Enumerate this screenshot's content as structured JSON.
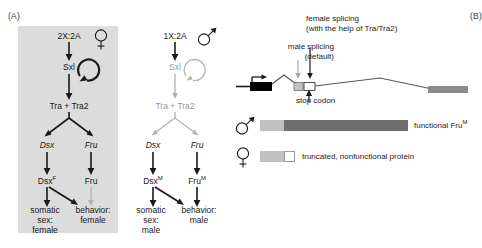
{
  "figure": {
    "panel_a_label": "(A)",
    "panel_b_label": "(B)"
  },
  "panel_a": {
    "female": {
      "sex_symbol": "female-symbol",
      "ratio": "2X:2A",
      "sxl": "Sxl",
      "tra": "Tra + Tra2",
      "dsx_gene": "Dsx",
      "fru_gene": "Fru",
      "dsx_protein": "Dsx",
      "dsx_protein_sup": "F",
      "fru_protein": "Fru",
      "fru_protein_sup": "",
      "outcome_left_line1": "somatic",
      "outcome_left_line2": "sex:",
      "outcome_left_line3": "female",
      "outcome_right_line1": "behavior:",
      "outcome_right_line2": "female"
    },
    "male": {
      "sex_symbol": "male-symbol",
      "ratio": "1X:2A",
      "sxl": "Sxl",
      "tra": "Tra + Tra2",
      "dsx_gene": "Dsx",
      "fru_gene": "Fru",
      "dsx_protein": "Dsx",
      "dsx_protein_sup": "M",
      "fru_protein": "Fru",
      "fru_protein_sup": "M",
      "outcome_left_line1": "somatic",
      "outcome_left_line2": "sex:",
      "outcome_left_line3": "male",
      "outcome_right_line1": "behavior:",
      "outcome_right_line2": "male"
    }
  },
  "panel_b": {
    "male_splicing_line1": "male splicing",
    "male_splicing_line2": "(default)",
    "female_splicing_line1": "female splicing",
    "female_splicing_line2": "(with the help of Tra/Tra2)",
    "stop_codon": "stop codon",
    "male_protein_label": "functional Fru",
    "male_protein_sup": "M",
    "female_protein_label": "truncated, nonfunctional protein",
    "male_symbol": "male-symbol",
    "female_symbol": "female-symbol"
  },
  "colors": {
    "panel_shade": "#dcdcdc",
    "active_black": "#1a1a1a",
    "inactive_gray": "#9a9a9a",
    "exon_dark": "#000000",
    "exon_gray": "#8c8c8c",
    "protein_dark": "#6e6e6e",
    "protein_light": "#c0c0c0"
  }
}
